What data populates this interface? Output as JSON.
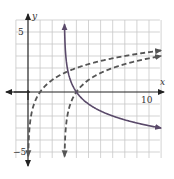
{
  "chart_data": {
    "type": "line",
    "title": "",
    "xlabel": "x",
    "ylabel": "y",
    "x_tick_labels": [
      {
        "value": 10,
        "label": "10"
      }
    ],
    "y_tick_labels": [
      {
        "value": 5,
        "label": "5"
      },
      {
        "value": -5,
        "label": "-5"
      }
    ],
    "xlim": [
      -2,
      11
    ],
    "ylim": [
      -6,
      6
    ],
    "grid": true,
    "series": [
      {
        "name": "y = log2(x)",
        "style": "dashed",
        "color": "#555555",
        "asymptote_x": 0,
        "x_intercept": 1,
        "points": [
          [
            0.03,
            -5.1
          ],
          [
            0.125,
            -3
          ],
          [
            0.25,
            -2
          ],
          [
            0.5,
            -1
          ],
          [
            1,
            0
          ],
          [
            2,
            1
          ],
          [
            4,
            2
          ],
          [
            8,
            3
          ],
          [
            11,
            3.46
          ]
        ]
      },
      {
        "name": "y = log2(x - 3)",
        "style": "dashed",
        "color": "#555555",
        "asymptote_x": 3,
        "x_intercept": 4,
        "points": [
          [
            3.03,
            -5.1
          ],
          [
            3.125,
            -3
          ],
          [
            3.25,
            -2
          ],
          [
            3.5,
            -1
          ],
          [
            4,
            0
          ],
          [
            5,
            1
          ],
          [
            7,
            2
          ],
          [
            11,
            3
          ]
        ]
      },
      {
        "name": "y = -log2(x - 3)",
        "style": "solid",
        "color": "#5a4a6a",
        "asymptote_x": 3,
        "x_intercept": 4,
        "points": [
          [
            3.02,
            5.6
          ],
          [
            3.125,
            3
          ],
          [
            3.25,
            2
          ],
          [
            3.5,
            1
          ],
          [
            4,
            0
          ],
          [
            5,
            -1
          ],
          [
            7,
            -2
          ],
          [
            11,
            -3
          ]
        ]
      }
    ]
  },
  "labels": {
    "x_axis": "x",
    "y_axis": "y",
    "tick_10": "10",
    "tick_5": "5",
    "tick_neg5": "−5"
  }
}
